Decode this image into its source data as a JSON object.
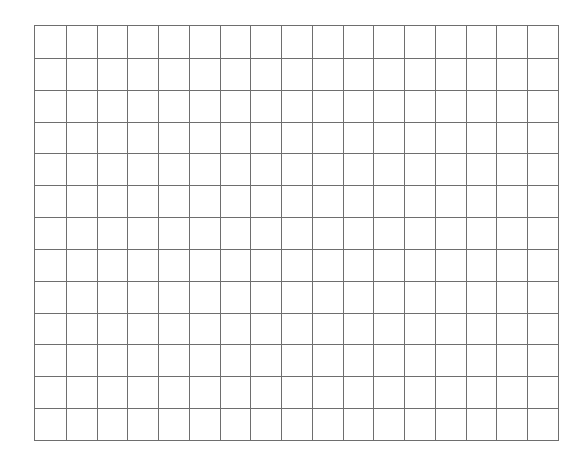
{
  "grid": {
    "columns": 17,
    "rows": 13,
    "line_color": "#6e6e6e",
    "background_color": "#ffffff",
    "cells": []
  }
}
